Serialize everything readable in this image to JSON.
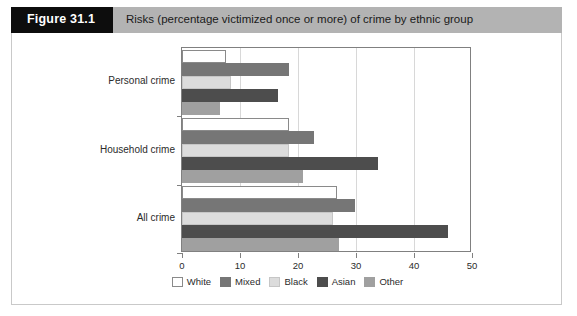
{
  "header": {
    "figure_number": "Figure 31.1",
    "title": "Risks (percentage victimized once or more) of crime by ethnic group",
    "band_color": "#b3b3b3",
    "number_box_color": "#0d0d0d"
  },
  "chart_data": {
    "type": "bar",
    "orientation": "horizontal",
    "title": "Risks (percentage victimized once or more) of crime by ethnic group",
    "xlabel": "",
    "ylabel": "",
    "xlim": [
      0,
      50
    ],
    "xticks": [
      0,
      10,
      20,
      30,
      40,
      50
    ],
    "xtick_labels": [
      "0",
      "10",
      "20",
      "30",
      "40",
      "50"
    ],
    "grid": true,
    "grid_axis": "x",
    "legend_position": "bottom",
    "categories": [
      "Personal crime",
      "Household crime",
      "All crime"
    ],
    "series": [
      {
        "name": "White",
        "color": "#ffffff",
        "values": [
          7.5,
          18.5,
          26.8
        ]
      },
      {
        "name": "Mixed",
        "color": "#767676",
        "values": [
          18.5,
          22.8,
          29.8
        ]
      },
      {
        "name": "Black",
        "color": "#dcdcdc",
        "values": [
          8.5,
          18.5,
          26.0
        ]
      },
      {
        "name": "Asian",
        "color": "#4d4d4d",
        "values": [
          16.5,
          33.8,
          45.8
        ]
      },
      {
        "name": "Other",
        "color": "#a0a0a0",
        "values": [
          6.5,
          20.8,
          27.0
        ]
      }
    ]
  }
}
